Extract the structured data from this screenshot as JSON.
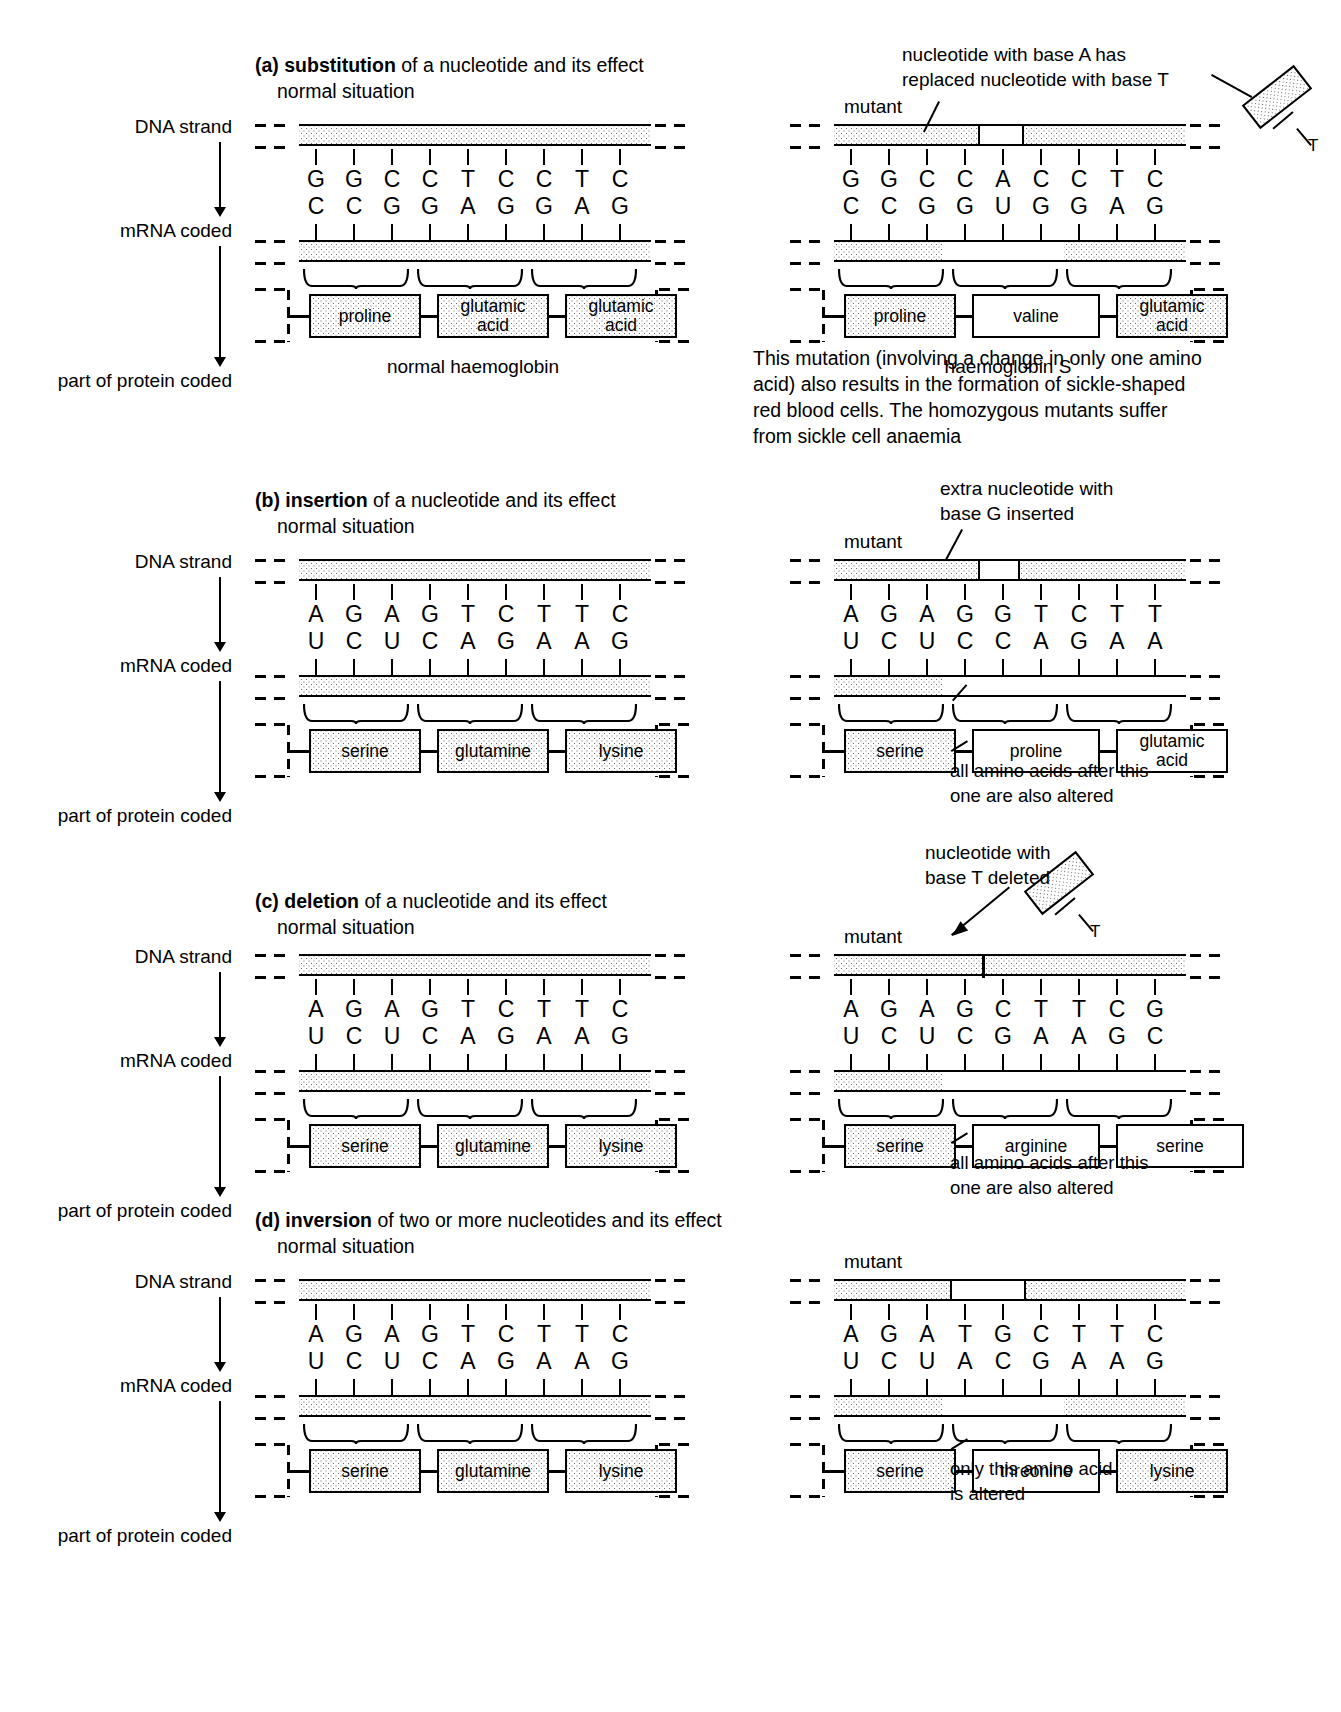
{
  "figure": {
    "side_labels": [
      "DNA strand",
      "mRNA coded",
      "part of protein coded"
    ],
    "mutant_label": "mutant",
    "normal_label": "normal situation"
  },
  "panels": [
    {
      "id": "a",
      "letter": "(a)",
      "keyword": "substitution",
      "title_rest": " of a nucleotide and its effect",
      "subtitle": "normal situation",
      "normal": {
        "top_bases": [
          "G",
          "G",
          "C",
          "C",
          "T",
          "C",
          "C",
          "T",
          "C"
        ],
        "bottom_bases": [
          "C",
          "C",
          "G",
          "G",
          "A",
          "G",
          "G",
          "A",
          "G"
        ],
        "amino_acids": [
          "proline",
          "glutamic\nacid",
          "glutamic\nacid"
        ],
        "caption": "normal haemoglobin"
      },
      "mutant": {
        "label": "mutant",
        "annotation": "nucleotide with base A has\nreplaced nucleotide with base T",
        "top_bases": [
          "G",
          "G",
          "C",
          "C",
          "A",
          "C",
          "C",
          "T",
          "C"
        ],
        "bottom_bases": [
          "C",
          "C",
          "G",
          "G",
          "U",
          "G",
          "G",
          "A",
          "G"
        ],
        "amino_acids": [
          "proline",
          "valine",
          "glutamic\nacid"
        ],
        "caption": "haemoglobin S",
        "detached_nucleotide_base": "T",
        "note": "This mutation (involving a change in only one amino\nacid) also results in the formation of sickle-shaped\nred blood cells. The homozygous mutants suffer\nfrom sickle cell anaemia"
      }
    },
    {
      "id": "b",
      "letter": "(b)",
      "keyword": "insertion",
      "title_rest": " of a nucleotide and its effect",
      "subtitle": "normal situation",
      "normal": {
        "top_bases": [
          "A",
          "G",
          "A",
          "G",
          "T",
          "C",
          "T",
          "T",
          "C"
        ],
        "bottom_bases": [
          "U",
          "C",
          "U",
          "C",
          "A",
          "G",
          "A",
          "A",
          "G"
        ],
        "amino_acids": [
          "serine",
          "glutamine",
          "lysine"
        ],
        "caption": ""
      },
      "mutant": {
        "label": "mutant",
        "annotation": "extra nucleotide with\nbase G inserted",
        "top_bases": [
          "A",
          "G",
          "A",
          "G",
          "G",
          "T",
          "C",
          "T",
          "T"
        ],
        "bottom_bases": [
          "U",
          "C",
          "U",
          "C",
          "C",
          "A",
          "G",
          "A",
          "A"
        ],
        "amino_acids": [
          "serine",
          "proline",
          "glutamic\nacid"
        ],
        "caption": "",
        "note": "all amino acids after this\none are also altered"
      }
    },
    {
      "id": "c",
      "letter": "(c)",
      "keyword": "deletion",
      "title_rest": " of a nucleotide and its effect",
      "subtitle": "normal situation",
      "normal": {
        "top_bases": [
          "A",
          "G",
          "A",
          "G",
          "T",
          "C",
          "T",
          "T",
          "C"
        ],
        "bottom_bases": [
          "U",
          "C",
          "U",
          "C",
          "A",
          "G",
          "A",
          "A",
          "G"
        ],
        "amino_acids": [
          "serine",
          "glutamine",
          "lysine"
        ],
        "caption": ""
      },
      "mutant": {
        "label": "mutant",
        "annotation": "nucleotide with\nbase T deleted",
        "top_bases": [
          "A",
          "G",
          "A",
          "G",
          "C",
          "T",
          "T",
          "C",
          "G"
        ],
        "bottom_bases": [
          "U",
          "C",
          "U",
          "C",
          "G",
          "A",
          "A",
          "G",
          "C"
        ],
        "amino_acids": [
          "serine",
          "arginine",
          "serine"
        ],
        "caption": "",
        "detached_nucleotide_base": "T",
        "note": "all amino acids after this\none are also altered"
      }
    },
    {
      "id": "d",
      "letter": "(d)",
      "keyword": "inversion",
      "title_rest": " of two or more nucleotides and its effect",
      "subtitle": "normal situation",
      "normal": {
        "top_bases": [
          "A",
          "G",
          "A",
          "G",
          "T",
          "C",
          "T",
          "T",
          "C"
        ],
        "bottom_bases": [
          "U",
          "C",
          "U",
          "C",
          "A",
          "G",
          "A",
          "A",
          "G"
        ],
        "amino_acids": [
          "serine",
          "glutamine",
          "lysine"
        ],
        "caption": ""
      },
      "mutant": {
        "label": "mutant",
        "annotation": "",
        "top_bases": [
          "A",
          "G",
          "A",
          "T",
          "G",
          "C",
          "T",
          "T",
          "C"
        ],
        "bottom_bases": [
          "U",
          "C",
          "U",
          "A",
          "C",
          "G",
          "A",
          "A",
          "G"
        ],
        "amino_acids": [
          "serine",
          "threonine",
          "lysine"
        ],
        "caption": "",
        "note": "only this amino acid\nis altered"
      }
    }
  ]
}
